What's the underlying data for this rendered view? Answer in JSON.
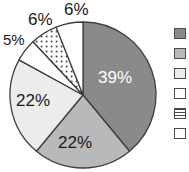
{
  "chart_data": {
    "type": "pie",
    "title": "",
    "labels": [
      "39%",
      "22%",
      "22%",
      "5%",
      "6%",
      "6%"
    ],
    "values": [
      39,
      22,
      22,
      5,
      6,
      6
    ],
    "categories": [
      "Series 1",
      "Series 2",
      "Series 3",
      "Series 4",
      "Series 5",
      "Series 6"
    ],
    "start_angle_deg": 0,
    "direction": "clockwise",
    "legend_position": "right",
    "grid": false,
    "slice_colors": [
      "#8a8a8a",
      "#b9b9b9",
      "#ececec",
      "#ffffff",
      "#ffffff",
      "#ffffff"
    ],
    "slice_patterns": [
      "solid",
      "solid",
      "solid",
      "solid",
      "dotted",
      "solid"
    ],
    "outline_color": "#3f3f3f",
    "label_text_colors": [
      "#ffffff",
      "#1a1a1a",
      "#1a1a1a",
      "#1a1a1a",
      "#1a1a1a",
      "#1a1a1a"
    ]
  },
  "pie": {
    "center_x": 83,
    "center_y": 95,
    "radius": 73,
    "slices": [
      {
        "id": "slice-39",
        "label": "39%",
        "value": 39,
        "fill": "#8a8a8a",
        "pattern": "solid",
        "label_x": 98,
        "label_y": 68,
        "text_class": "on-dark"
      },
      {
        "id": "slice-22-bottom",
        "label": "22%",
        "value": 22,
        "fill": "#b9b9b9",
        "pattern": "solid",
        "label_x": 58,
        "label_y": 133,
        "text_class": ""
      },
      {
        "id": "slice-22-left",
        "label": "22%",
        "value": 22,
        "fill": "#ececec",
        "pattern": "solid",
        "label_x": 16,
        "label_y": 91,
        "text_class": ""
      },
      {
        "id": "slice-5",
        "label": "5%",
        "value": 5,
        "fill": "#ffffff",
        "pattern": "solid",
        "label_x": 3,
        "label_y": 31,
        "text_class": "small"
      },
      {
        "id": "slice-6-dotted",
        "label": "6%",
        "value": 6,
        "fill": "#ffffff",
        "pattern": "dotted",
        "label_x": 28,
        "label_y": 10,
        "text_class": ""
      },
      {
        "id": "slice-6-white",
        "label": "6%",
        "value": 6,
        "fill": "#ffffff",
        "pattern": "solid",
        "label_x": 64,
        "label_y": 0,
        "text_class": ""
      }
    ]
  },
  "legend": {
    "items": [
      {
        "swatch": "#8a8a8a",
        "pattern": "solid",
        "label": ""
      },
      {
        "swatch": "#b9b9b9",
        "pattern": "solid",
        "label": ""
      },
      {
        "swatch": "#ececec",
        "pattern": "solid",
        "label": ""
      },
      {
        "swatch": "#ffffff",
        "pattern": "solid",
        "label": ""
      },
      {
        "swatch": "#ffffff",
        "pattern": "hlines",
        "label": ""
      },
      {
        "swatch": "#ffffff",
        "pattern": "solid",
        "label": ""
      }
    ]
  }
}
